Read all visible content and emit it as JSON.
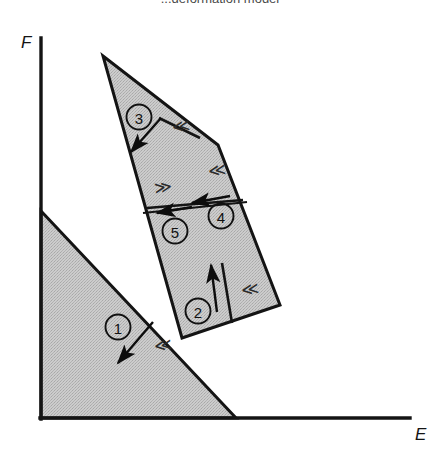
{
  "figure": {
    "caption_partial": "...deformation model",
    "background_color": "#ffffff",
    "fill_color": "#c6c6c6",
    "stroke_color": "#141414"
  },
  "axes": {
    "vertical": {
      "label": "F",
      "name": "f-axis"
    },
    "horizontal": {
      "label": "E",
      "name": "e-axis"
    }
  },
  "regions": [
    {
      "id": "1",
      "label": "1",
      "cx": 118,
      "cy": 327
    },
    {
      "id": "2",
      "label": "2",
      "cx": 198,
      "cy": 311
    },
    {
      "id": "3",
      "label": "3",
      "cx": 139,
      "cy": 117
    },
    {
      "id": "4",
      "label": "4",
      "cx": 221,
      "cy": 216
    },
    {
      "id": "5",
      "label": "5",
      "cx": 175,
      "cy": 231
    }
  ],
  "shear_markers": [
    {
      "id": "m1",
      "glyph": "≪",
      "x": 155,
      "y": 352,
      "rotate": -8
    },
    {
      "id": "m2",
      "glyph": "≪",
      "x": 242,
      "y": 296,
      "rotate": -8
    },
    {
      "id": "m3",
      "glyph": "≪",
      "x": 173,
      "y": 133,
      "rotate": -8
    },
    {
      "id": "m4",
      "glyph": "≪",
      "x": 209,
      "y": 177,
      "rotate": -8
    },
    {
      "id": "m5",
      "glyph": "≫",
      "x": 155,
      "y": 194,
      "rotate": -8
    }
  ],
  "shapes": {
    "lower_block": {
      "name": "lower-left-fault-block",
      "points": "41,211 236,418 41,418"
    },
    "upper_block": {
      "name": "upper-fault-block",
      "points": "103,56 218,145 280,305 182,338"
    }
  }
}
